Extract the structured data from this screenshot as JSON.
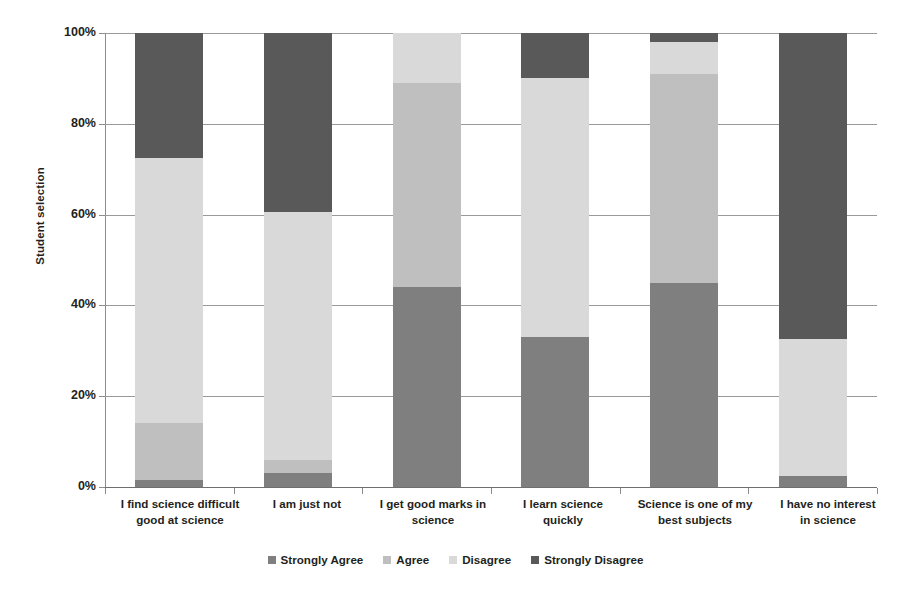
{
  "chart_data": {
    "type": "bar",
    "subtype": "stacked-bar-100-percent",
    "title": "",
    "xlabel": "",
    "ylabel": "Student selection",
    "ylim": [
      0,
      100
    ],
    "ytick_labels": [
      "0%",
      "20%",
      "40%",
      "60%",
      "80%",
      "100%"
    ],
    "ytick_values": [
      0,
      20,
      40,
      60,
      80,
      100
    ],
    "grid": true,
    "legend_position": "bottom",
    "stack_order_bottom_to_top": [
      "Strongly Agree",
      "Agree",
      "Disagree",
      "Strongly Disagree"
    ],
    "categories": [
      "I find science difficult",
      "I am  just not good at science",
      "I get good marks in science",
      "I learn science quickly",
      "Science is one of my best subjects",
      "I have no interest in science"
    ],
    "series": [
      {
        "name": "Strongly Agree",
        "color": "#7f7f7f",
        "values": [
          1.5,
          3.0,
          44.0,
          33.0,
          45.0,
          2.5
        ]
      },
      {
        "name": "Agree",
        "color": "#bfbfbf",
        "values": [
          12.5,
          3.0,
          45.0,
          0.0,
          46.0,
          0.0
        ]
      },
      {
        "name": "Disagree",
        "color": "#d9d9d9",
        "values": [
          58.5,
          54.5,
          11.0,
          57.0,
          7.0,
          30.0
        ]
      },
      {
        "name": "Strongly Disagree",
        "color": "#595959",
        "values": [
          27.5,
          39.5,
          0.0,
          10.0,
          2.0,
          67.5
        ]
      }
    ]
  },
  "axis": {
    "y_title": "Student selection",
    "ticks": [
      {
        "label": "100%",
        "value": 100
      },
      {
        "label": "80%",
        "value": 80
      },
      {
        "label": "60%",
        "value": 60
      },
      {
        "label": "40%",
        "value": 40
      },
      {
        "label": "20%",
        "value": 20
      },
      {
        "label": "0%",
        "value": 0
      }
    ]
  },
  "categories": [
    {
      "line1": "I find science difficult",
      "line2": "good at science",
      "full": "I find science difficult good at science"
    },
    {
      "line1": "I am  just not",
      "line2": "",
      "full": "I am  just not good at science"
    },
    {
      "line1": "I get good marks in",
      "line2": "science",
      "full": "I get good marks in science"
    },
    {
      "line1": "I learn science",
      "line2": "quickly",
      "full": "I learn science quickly"
    },
    {
      "line1": "Science is one of my",
      "line2": "best subjects",
      "full": "Science is one of my best subjects"
    },
    {
      "line1": "I have no interest",
      "line2": "in science",
      "full": "I have no interest in science"
    }
  ],
  "legend": {
    "items": [
      {
        "label": "Strongly Agree",
        "color": "#7f7f7f"
      },
      {
        "label": "Agree",
        "color": "#bfbfbf"
      },
      {
        "label": "Disagree",
        "color": "#d9d9d9"
      },
      {
        "label": "Strongly Disagree",
        "color": "#595959"
      }
    ]
  },
  "colors": {
    "strongly_agree": "#7f7f7f",
    "agree": "#bfbfbf",
    "disagree": "#d9d9d9",
    "strongly_disagree": "#595959",
    "gridline": "#9a9a9a",
    "axis": "#8c8c8c",
    "text": "#231f20",
    "background": "#ffffff"
  }
}
